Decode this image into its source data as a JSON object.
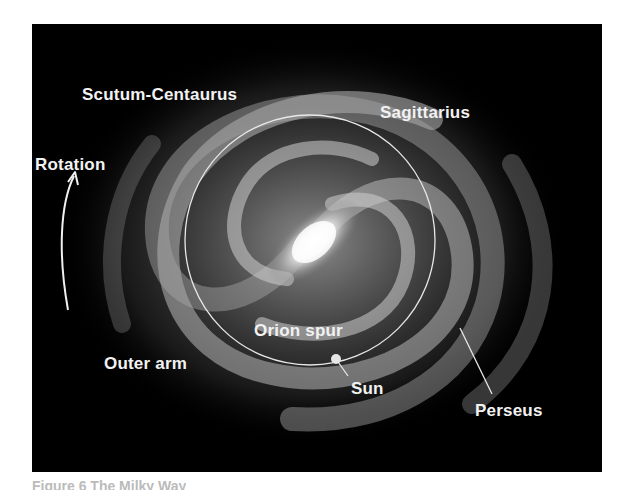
{
  "figure": {
    "labels": {
      "scutum_centaurus": "Scutum-Centaurus",
      "sagittarius": "Sagittarius",
      "rotation": "Rotation",
      "orion_spur": "Orion spur",
      "outer_arm": "Outer arm",
      "sun": "Sun",
      "perseus": "Perseus"
    },
    "caption_partial": "Figure 6  The Milky Way"
  },
  "colors": {
    "background": "#000000",
    "label": "#f2f2f2",
    "page": "#ffffff"
  }
}
